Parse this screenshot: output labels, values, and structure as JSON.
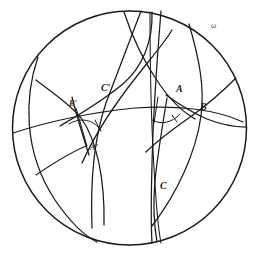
{
  "figure": {
    "type": "geometry-diagram",
    "model": "poincare-disk",
    "stroke_color": "#1a1a1a",
    "background_color": "#ffffff",
    "boundary": {
      "name": "omega",
      "label": "ω",
      "label_x": 211,
      "label_y": 28,
      "center_x": 129.5,
      "center_y": 128,
      "radius": 117
    },
    "labels": [
      {
        "id": "A",
        "text": "A",
        "x": 176,
        "y": 92,
        "size": "large"
      },
      {
        "id": "B",
        "text": "B",
        "x": 200,
        "y": 110,
        "size": "large"
      },
      {
        "id": "C",
        "text": "C",
        "x": 160,
        "y": 189,
        "size": "large"
      },
      {
        "id": "Ap",
        "text": "A′",
        "x": 90,
        "y": 150,
        "size": "small"
      },
      {
        "id": "Bp",
        "text": "B′",
        "x": 69,
        "y": 106,
        "size": "small"
      },
      {
        "id": "Cp",
        "text": "C′",
        "x": 101,
        "y": 91,
        "size": "large"
      }
    ],
    "vertices": {
      "A": {
        "x": 168,
        "y": 96
      },
      "B": {
        "x": 193,
        "y": 113
      },
      "C": {
        "x": 155,
        "y": 185
      },
      "Ap": {
        "x": 85,
        "y": 145
      },
      "Bp": {
        "x": 76,
        "y": 112
      },
      "Cp": {
        "x": 111,
        "y": 96
      }
    },
    "angles_marked": [
      {
        "vertex": "A",
        "label": "angle-A-mark"
      },
      {
        "vertex": "Ap",
        "label": "angle-Aprime-mark"
      }
    ],
    "geodesics": [
      {
        "id": "g1",
        "note": "arc through C down-left, long sweeping geodesic"
      },
      {
        "id": "g2",
        "note": "arc through A and C near center-right"
      },
      {
        "id": "g3",
        "note": "arc B to upper region"
      },
      {
        "id": "g4",
        "note": "arc through B' and A' on the left"
      },
      {
        "id": "g5",
        "note": "arc through C' crossing the disk"
      },
      {
        "id": "g6",
        "note": "near vertical pair of arcs through C"
      },
      {
        "id": "g7",
        "note": "left horizontal arc chord"
      },
      {
        "id": "g8",
        "note": "right arc through B"
      }
    ]
  }
}
